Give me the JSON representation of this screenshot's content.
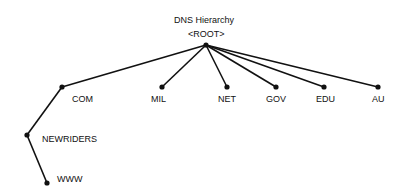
{
  "diagram": {
    "title": "DNS Hierarchy",
    "root": {
      "label": "<ROOT>",
      "x": 206,
      "y": 45
    },
    "nodes": [
      {
        "id": "com",
        "label": "COM",
        "x": 62,
        "y": 87,
        "parent": "root",
        "lx": 72,
        "ly": 97
      },
      {
        "id": "mil",
        "label": "MIL",
        "x": 162,
        "y": 87,
        "parent": "root",
        "lx": 151,
        "ly": 97
      },
      {
        "id": "net",
        "label": "NET",
        "x": 227,
        "y": 87,
        "parent": "root",
        "lx": 218,
        "ly": 97
      },
      {
        "id": "gov",
        "label": "GOV",
        "x": 276,
        "y": 87,
        "parent": "root",
        "lx": 266,
        "ly": 97
      },
      {
        "id": "edu",
        "label": "EDU",
        "x": 324,
        "y": 87,
        "parent": "root",
        "lx": 316,
        "ly": 97
      },
      {
        "id": "au",
        "label": "AU",
        "x": 378,
        "y": 87,
        "parent": "root",
        "lx": 372,
        "ly": 97
      },
      {
        "id": "newriders",
        "label": "NEWRIDERS",
        "x": 27,
        "y": 135,
        "parent": "com",
        "lx": 42,
        "ly": 135
      },
      {
        "id": "www",
        "label": "WWW",
        "x": 47,
        "y": 183,
        "parent": "newriders",
        "lx": 57,
        "ly": 175
      }
    ]
  }
}
